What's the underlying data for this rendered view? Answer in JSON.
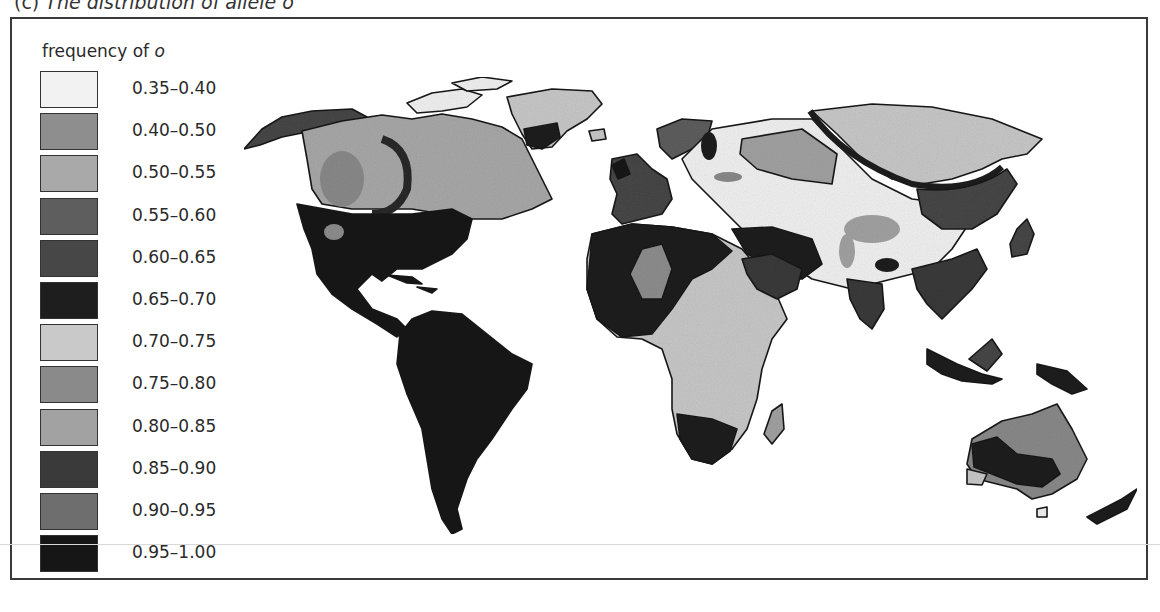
{
  "figure": {
    "caption_prefix": "(c)",
    "caption": "The distribution of allele o"
  },
  "legend": {
    "title_text": "frequency of ",
    "title_italic": "o",
    "items": [
      {
        "label": "0.35–0.40",
        "color": "#f2f2f2"
      },
      {
        "label": "0.40–0.50",
        "color": "#8e8e8e"
      },
      {
        "label": "0.50–0.55",
        "color": "#a9a9a9"
      },
      {
        "label": "0.55–0.60",
        "color": "#5e5e5e"
      },
      {
        "label": "0.60–0.65",
        "color": "#474747"
      },
      {
        "label": "0.65–0.70",
        "color": "#1e1e1e"
      },
      {
        "label": "0.70–0.75",
        "color": "#c9c9c9"
      },
      {
        "label": "0.75–0.80",
        "color": "#8a8a8a"
      },
      {
        "label": "0.80–0.85",
        "color": "#a2a2a2"
      },
      {
        "label": "0.85–0.90",
        "color": "#3a3a3a"
      },
      {
        "label": "0.90–0.95",
        "color": "#6e6e6e"
      },
      {
        "label": "0.95–1.00",
        "color": "#161616"
      }
    ]
  },
  "map": {
    "title": "World map of allele o frequency",
    "regions": [
      {
        "name": "South America",
        "band": "0.95–1.00"
      },
      {
        "name": "Central America & Mexico",
        "band": "0.95–1.00"
      },
      {
        "name": "Southern USA",
        "band": "0.95–1.00"
      },
      {
        "name": "Canada",
        "band": "0.70–0.75"
      },
      {
        "name": "Greenland",
        "band": "0.70–0.75"
      },
      {
        "name": "Siberia",
        "band": "0.70–0.75"
      },
      {
        "name": "Central Asia",
        "band": "0.35–0.40"
      },
      {
        "name": "Western Europe",
        "band": "0.60–0.65"
      },
      {
        "name": "Sub-Saharan Africa",
        "band": "0.70–0.75"
      },
      {
        "name": "North Africa",
        "band": "0.65–0.70"
      },
      {
        "name": "Australia",
        "band": "0.75–0.80"
      }
    ]
  }
}
